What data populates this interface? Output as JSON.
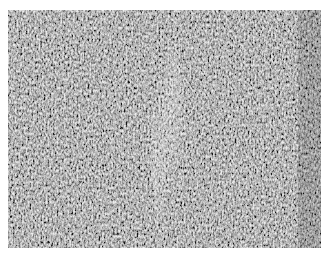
{
  "image": {
    "description": "Grayscale micrograph of densely packed spindle-shaped cells with a lighter diagonal band through the center",
    "palette": {
      "base": "#8a8a8a",
      "dark": "#3c3c3c",
      "light": "#d8d8d8",
      "border": "#ffffff"
    }
  }
}
